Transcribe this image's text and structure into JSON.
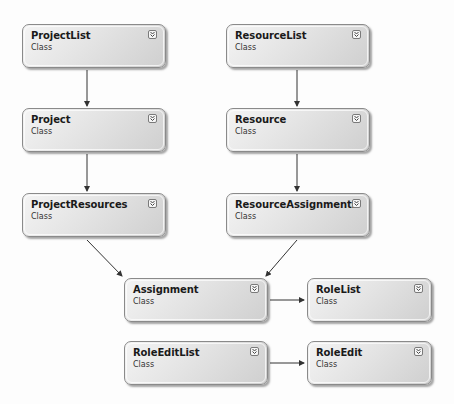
{
  "diagram": {
    "type": "class-diagram",
    "colors": {
      "box_border": "#8a8a8a",
      "box_fill_light": "#f4f4f4",
      "box_fill_dark": "#cfcfcf",
      "connector": "#333333",
      "background": "#ffffff"
    },
    "classes": [
      {
        "id": "ProjectList",
        "name": "ProjectList",
        "kind": "Class",
        "x": 22,
        "y": 24,
        "w": 144
      },
      {
        "id": "ResourceList",
        "name": "ResourceList",
        "kind": "Class",
        "x": 226,
        "y": 24,
        "w": 144
      },
      {
        "id": "Project",
        "name": "Project",
        "kind": "Class",
        "x": 22,
        "y": 108,
        "w": 144
      },
      {
        "id": "Resource",
        "name": "Resource",
        "kind": "Class",
        "x": 226,
        "y": 108,
        "w": 144
      },
      {
        "id": "ProjectResources",
        "name": "ProjectResources",
        "kind": "Class",
        "x": 22,
        "y": 193,
        "w": 144
      },
      {
        "id": "ResourceAssignments",
        "name": "ResourceAssignments",
        "kind": "Class",
        "x": 226,
        "y": 193,
        "w": 144
      },
      {
        "id": "Assignment",
        "name": "Assignment",
        "kind": "Class",
        "x": 124,
        "y": 278,
        "w": 144
      },
      {
        "id": "RoleList",
        "name": "RoleList",
        "kind": "Class",
        "x": 307,
        "y": 278,
        "w": 125
      },
      {
        "id": "RoleEditList",
        "name": "RoleEditList",
        "kind": "Class",
        "x": 124,
        "y": 341,
        "w": 144
      },
      {
        "id": "RoleEdit",
        "name": "RoleEdit",
        "kind": "Class",
        "x": 307,
        "y": 341,
        "w": 125
      }
    ],
    "connections": [
      {
        "from": "ProjectList",
        "to": "Project"
      },
      {
        "from": "ResourceList",
        "to": "Resource"
      },
      {
        "from": "Project",
        "to": "ProjectResources"
      },
      {
        "from": "Resource",
        "to": "ResourceAssignments"
      },
      {
        "from": "ProjectResources",
        "to": "Assignment"
      },
      {
        "from": "ResourceAssignments",
        "to": "Assignment"
      },
      {
        "from": "Assignment",
        "to": "RoleList"
      },
      {
        "from": "RoleEditList",
        "to": "RoleEdit"
      }
    ],
    "expand_icon": "double-chevron-down-icon"
  }
}
